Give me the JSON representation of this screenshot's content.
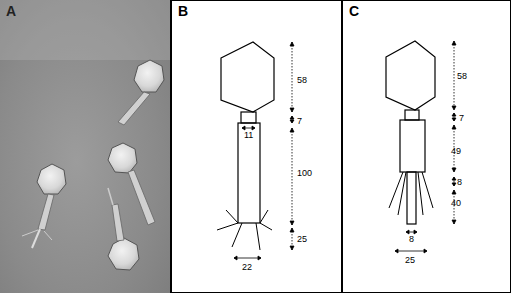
{
  "figure": {
    "panels": [
      {
        "id": "A",
        "label": "A",
        "type": "electron-micrograph",
        "description": "Negatively stained phage particles with icosahedral heads and contractile tails"
      },
      {
        "id": "B",
        "label": "B",
        "type": "schematic",
        "dimensions": {
          "head_height": "58",
          "collar_height": "7",
          "collar_width": "11",
          "tail_length": "100",
          "baseplate_height": "25",
          "baseplate_width": "22"
        }
      },
      {
        "id": "C",
        "label": "C",
        "type": "schematic",
        "dimensions": {
          "head_height": "58",
          "collar_height": "7",
          "sheath_length": "49",
          "gap": "8",
          "core_length": "40",
          "core_width": "8",
          "fiber_span": "25"
        }
      }
    ],
    "colors": {
      "line": "#000000",
      "background": "#ffffff",
      "micrograph_bg": "#8a8a8a"
    }
  }
}
